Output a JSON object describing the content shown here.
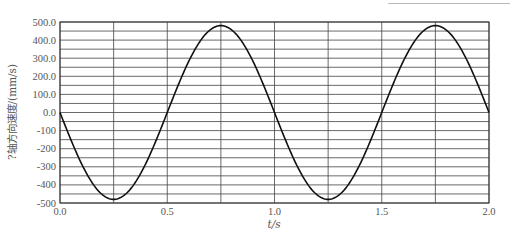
{
  "chart_data": {
    "type": "line",
    "title": "",
    "xlabel": "t/s",
    "ylabel": "?轴方向速度/(mm/s)",
    "xlim": [
      0.0,
      2.0
    ],
    "ylim": [
      -500,
      500
    ],
    "x_ticks": [
      "0.0",
      "0.5",
      "1.0",
      "1.5",
      "2.0"
    ],
    "y_ticks": [
      "500.0",
      "400.0",
      "300.0",
      "200.0",
      "100.0",
      "0.0",
      "-100",
      "-200",
      "-300",
      "-400",
      "-500"
    ],
    "grid": {
      "x_step": 0.25,
      "y_step": 50
    },
    "series": [
      {
        "name": "velocity",
        "function": "-480*sin(2*pi*t)",
        "x": [
          0.0,
          0.125,
          0.25,
          0.375,
          0.5,
          0.625,
          0.75,
          0.875,
          1.0,
          1.125,
          1.25,
          1.375,
          1.5,
          1.625,
          1.75,
          1.875,
          2.0
        ],
        "values": [
          0,
          -339,
          -480,
          -339,
          0,
          339,
          480,
          339,
          0,
          -339,
          -480,
          -339,
          0,
          339,
          480,
          339,
          0
        ]
      }
    ],
    "legend": null
  },
  "axes": {
    "xlabel": "t/s",
    "ylabel": "?轴方向速度/(mm/s)"
  }
}
